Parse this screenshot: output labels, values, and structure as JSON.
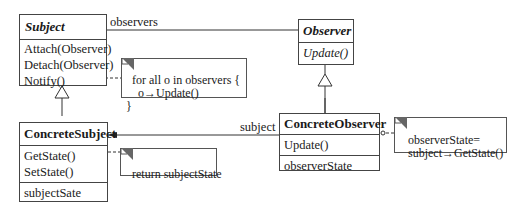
{
  "diagram": {
    "type": "UML class diagram",
    "pattern": "Observer",
    "classes": {
      "subject": {
        "name": "Subject",
        "abstract": true,
        "operations": [
          "Attach(Observer)",
          "Detach(Observer)",
          "Notify()"
        ]
      },
      "observer": {
        "name": "Observer",
        "abstract": true,
        "operations": [
          "Update()"
        ]
      },
      "concrete_subject": {
        "name": "ConcreteSubject",
        "operations": [
          "GetState()",
          "SetState()"
        ],
        "attributes": [
          "subjectSate"
        ]
      },
      "concrete_observer": {
        "name": "ConcreteObserver",
        "operations": [
          "Update()"
        ],
        "attributes": [
          "observerState"
        ]
      }
    },
    "associations": {
      "observers_label": "observers",
      "subject_label": "subject"
    },
    "notes": {
      "notify_note": "for all o in observers {\n    o→Update()\n}",
      "getstate_note": "return subjectState",
      "update_note": "observerState=\n  subject→GetState()"
    }
  }
}
